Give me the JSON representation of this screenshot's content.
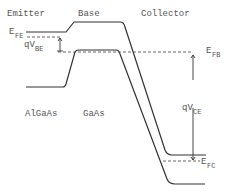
{
  "diagram": {
    "regions": [
      {
        "label": "Emitter"
      },
      {
        "label": "Base"
      },
      {
        "label": "Collector"
      }
    ],
    "materials": [
      {
        "label": "AlGaAs"
      },
      {
        "label": "GaAs"
      }
    ],
    "fermi_levels": {
      "emitter": {
        "main": "E",
        "sub": "FE"
      },
      "base": {
        "main": "E",
        "sub": "FB"
      },
      "collector": {
        "main": "E",
        "sub": "FC"
      }
    },
    "voltages": {
      "base_emitter": {
        "main": "qV",
        "sub": "BE"
      },
      "collector_emitter": {
        "main": "qV",
        "sub": "CE"
      }
    },
    "colors": {
      "line": "#333333",
      "text": "#555555",
      "background": "#ffffff"
    }
  }
}
